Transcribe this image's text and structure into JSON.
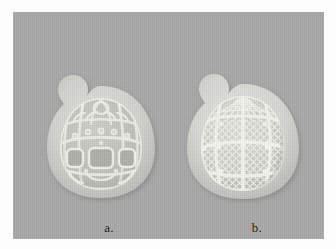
{
  "figure": {
    "background_color": "#a9a9a9",
    "plate_color": "#fdfdfd",
    "specimen_color": "#d8d8d4",
    "halo_color": "#c9c9c5",
    "mesh_color": "#eeeeea"
  },
  "panels": [
    {
      "id": "a",
      "caption": "a.",
      "icon": "radiolarian-coarse-pore-specimen",
      "description": "ovate shell with apical horn, coarse rectangular pores, radial ribs over dome"
    },
    {
      "id": "b",
      "caption": "b.",
      "icon": "radiolarian-fine-mesh-specimen",
      "description": "ovate shell with apical horn, fine diagonal lattice mesh within ribbed panels"
    }
  ]
}
